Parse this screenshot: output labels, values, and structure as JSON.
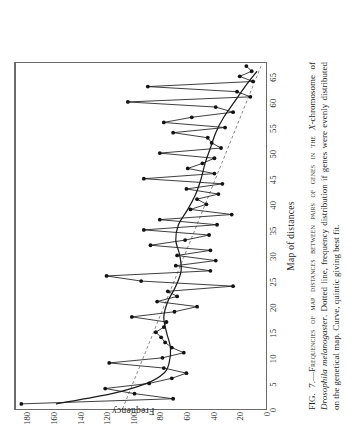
{
  "figure": {
    "label": "FIG. 7.",
    "caption_text": "FIG. 7.—Frequencies of map distances between pairs of genes in the X-chromosome of Drosophila melanogaster. Dotted line, frequency distribution if genes were evenly distributed on the genetical map. Curve, quintic giving best fit.",
    "caption_part1": "FIG. 7.—Frequencies of map distances between pairs of genes in the ",
    "caption_italic1": "X",
    "caption_part2": "-chromosome of ",
    "caption_italic2": "Drosophila melanogaster",
    "caption_part3": ". Dotted line, frequency distribution if genes were evenly distributed on the genetical map.  Curve, quintic giving best fit."
  },
  "chart_data": {
    "type": "line",
    "title": "",
    "xlabel": "Map of distances",
    "ylabel": "Frequency",
    "xlim": [
      0,
      68
    ],
    "ylim": [
      0,
      190
    ],
    "xticks": [
      0,
      5,
      10,
      15,
      20,
      25,
      30,
      35,
      40,
      45,
      50,
      55,
      60,
      65
    ],
    "yticks": [
      0,
      20,
      40,
      60,
      80,
      100,
      120,
      140,
      160,
      180
    ],
    "grid": false,
    "legend": "none",
    "series": [
      {
        "name": "Observed frequency of map distances",
        "style": "solid-with-markers",
        "markers": true,
        "x": [
          1,
          2,
          3,
          4,
          5,
          6,
          7,
          8,
          9,
          10,
          11,
          12,
          13,
          14,
          15,
          16,
          17,
          18,
          19,
          20,
          21,
          22,
          23,
          24,
          25,
          26,
          27,
          28,
          29,
          30,
          31,
          32,
          33,
          34,
          35,
          36,
          37,
          38,
          39,
          40,
          41,
          42,
          43,
          44,
          45,
          46,
          47,
          48,
          49,
          50,
          51,
          52,
          53,
          54,
          55,
          56,
          57,
          58,
          59,
          60,
          61,
          62,
          63,
          64,
          65,
          66,
          67
        ],
        "values": [
          186,
          72,
          101,
          123,
          90,
          73,
          62,
          79,
          120,
          80,
          64,
          73,
          78,
          81,
          85,
          79,
          77,
          103,
          71,
          54,
          84,
          69,
          76,
          27,
          96,
          122,
          44,
          70,
          40,
          69,
          44,
          89,
          63,
          45,
          94,
          39,
          82,
          28,
          59,
          47,
          54,
          38,
          62,
          35,
          94,
          41,
          61,
          50,
          41,
          82,
          36,
          43,
          46,
          72,
          33,
          79,
          58,
          27,
          40,
          106,
          14,
          24,
          91,
          12,
          22,
          13,
          17
        ]
      },
      {
        "name": "Dotted line, even distribution on genetical map",
        "style": "dotted",
        "markers": false,
        "x": [
          0,
          67
        ],
        "values": [
          110,
          6
        ]
      },
      {
        "name": "Curve, quintic giving best fit",
        "style": "smooth-curve",
        "markers": false,
        "x": [
          1,
          3,
          5,
          7,
          9,
          12,
          15,
          18,
          21,
          24,
          27,
          30,
          33,
          36,
          39,
          42,
          45,
          48,
          51,
          54,
          57,
          60,
          63,
          66
        ],
        "values": [
          160,
          118,
          92,
          79,
          75,
          74,
          77,
          79,
          76,
          70,
          66,
          67,
          70,
          68,
          61,
          55,
          51,
          48,
          44,
          40,
          34,
          26,
          18,
          9
        ]
      }
    ]
  }
}
